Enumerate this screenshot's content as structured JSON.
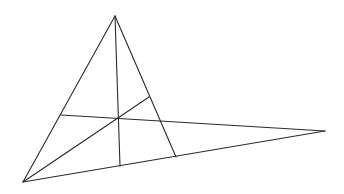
{
  "diagram": {
    "stroke_color": "#2a2a2a",
    "background": "#ffffff",
    "points": {
      "A": [
        115,
        16
      ],
      "B": [
        23,
        182
      ],
      "C": [
        325,
        131
      ],
      "H": [
        118,
        118
      ],
      "foot_A_on_BC": [
        120,
        166
      ],
      "foot_B_on_AC": [
        149,
        97
      ],
      "foot_C_on_AB": [
        61,
        115
      ],
      "side_AC_end_on_BC": [
        176,
        157
      ]
    },
    "segments": [
      {
        "name": "side-ab",
        "from": "A",
        "to": "B",
        "x1": 115,
        "y1": 16,
        "x2": 23,
        "y2": 182
      },
      {
        "name": "side-a-to-bc",
        "from": "A",
        "to": "side_AC_end_on_BC",
        "x1": 115,
        "y1": 16,
        "x2": 176,
        "y2": 157
      },
      {
        "name": "side-bc",
        "from": "B",
        "to": "C",
        "x1": 23,
        "y1": 182,
        "x2": 325,
        "y2": 131
      },
      {
        "name": "altitude-from-a",
        "from": "A",
        "to": "foot_A_on_BC",
        "x1": 115,
        "y1": 16,
        "x2": 120,
        "y2": 166
      },
      {
        "name": "altitude-from-b",
        "from": "B",
        "to": "foot_B_on_AC",
        "x1": 23,
        "y1": 182,
        "x2": 149,
        "y2": 97
      },
      {
        "name": "altitude-from-c",
        "from": "C",
        "to": "foot_C_on_AB",
        "x1": 325,
        "y1": 131,
        "x2": 61,
        "y2": 115
      }
    ]
  }
}
